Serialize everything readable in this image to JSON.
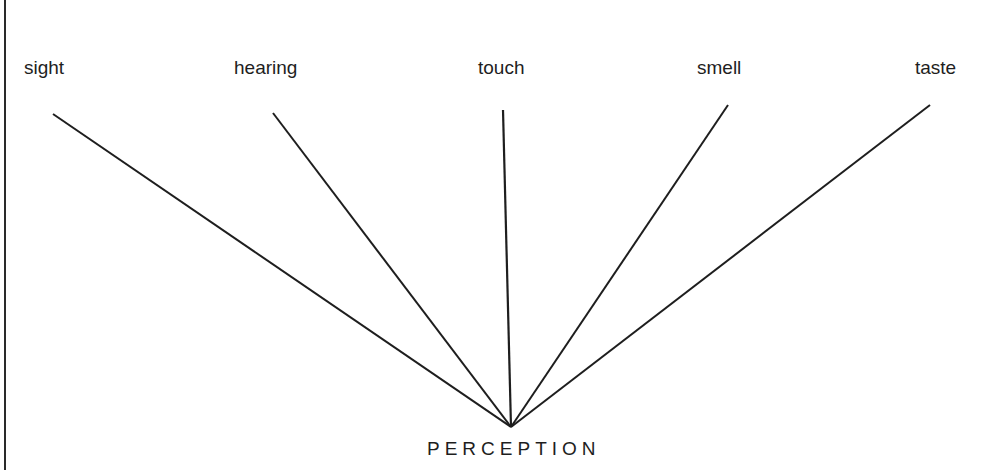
{
  "diagram": {
    "senses": [
      {
        "label": "sight",
        "x": 24,
        "y": 52,
        "line_x": 53,
        "line_y": 114
      },
      {
        "label": "hearing",
        "x": 234,
        "y": 52,
        "line_x": 273,
        "line_y": 113
      },
      {
        "label": "touch",
        "x": 478,
        "y": 52,
        "line_x": 503,
        "line_y": 110
      },
      {
        "label": "smell",
        "x": 696,
        "y": 52,
        "line_x": 728,
        "line_y": 105
      },
      {
        "label": "taste",
        "x": 915,
        "y": 52,
        "line_x": 930,
        "line_y": 105
      }
    ],
    "convergence_point": {
      "x": 511,
      "y": 427
    },
    "result_label": "PERCEPTION",
    "line_color": "#1e1e1e"
  }
}
